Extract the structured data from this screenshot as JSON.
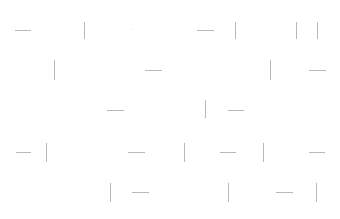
{
  "line_color": "#b8b8b8",
  "segments": [
    {
      "o": "h",
      "x": 15,
      "y": 30,
      "len": 16
    },
    {
      "o": "v",
      "x": 84,
      "y": 22,
      "len": 17
    },
    {
      "o": "dot",
      "x": 132,
      "y": 29,
      "len": 1
    },
    {
      "o": "h",
      "x": 197,
      "y": 30,
      "len": 17
    },
    {
      "o": "v",
      "x": 235,
      "y": 22,
      "len": 17
    },
    {
      "o": "v",
      "x": 296,
      "y": 22,
      "len": 17
    },
    {
      "o": "v",
      "x": 317,
      "y": 22,
      "len": 17
    },
    {
      "o": "v",
      "x": 54,
      "y": 60,
      "len": 20
    },
    {
      "o": "h",
      "x": 145,
      "y": 70,
      "len": 17
    },
    {
      "o": "v",
      "x": 270,
      "y": 60,
      "len": 20
    },
    {
      "o": "h",
      "x": 309,
      "y": 70,
      "len": 17
    },
    {
      "o": "h",
      "x": 107,
      "y": 110,
      "len": 17
    },
    {
      "o": "v",
      "x": 205,
      "y": 100,
      "len": 18
    },
    {
      "o": "h",
      "x": 228,
      "y": 110,
      "len": 16
    },
    {
      "o": "h",
      "x": 16,
      "y": 152,
      "len": 15
    },
    {
      "o": "v",
      "x": 46,
      "y": 143,
      "len": 19
    },
    {
      "o": "h",
      "x": 128,
      "y": 152,
      "len": 17
    },
    {
      "o": "v",
      "x": 184,
      "y": 143,
      "len": 19
    },
    {
      "o": "h",
      "x": 220,
      "y": 152,
      "len": 16
    },
    {
      "o": "v",
      "x": 263,
      "y": 143,
      "len": 19
    },
    {
      "o": "h",
      "x": 309,
      "y": 152,
      "len": 16
    },
    {
      "o": "v",
      "x": 110,
      "y": 183,
      "len": 19
    },
    {
      "o": "h",
      "x": 132,
      "y": 192,
      "len": 17
    },
    {
      "o": "v",
      "x": 228,
      "y": 183,
      "len": 19
    },
    {
      "o": "h",
      "x": 276,
      "y": 192,
      "len": 17
    },
    {
      "o": "v",
      "x": 316,
      "y": 183,
      "len": 19
    }
  ]
}
